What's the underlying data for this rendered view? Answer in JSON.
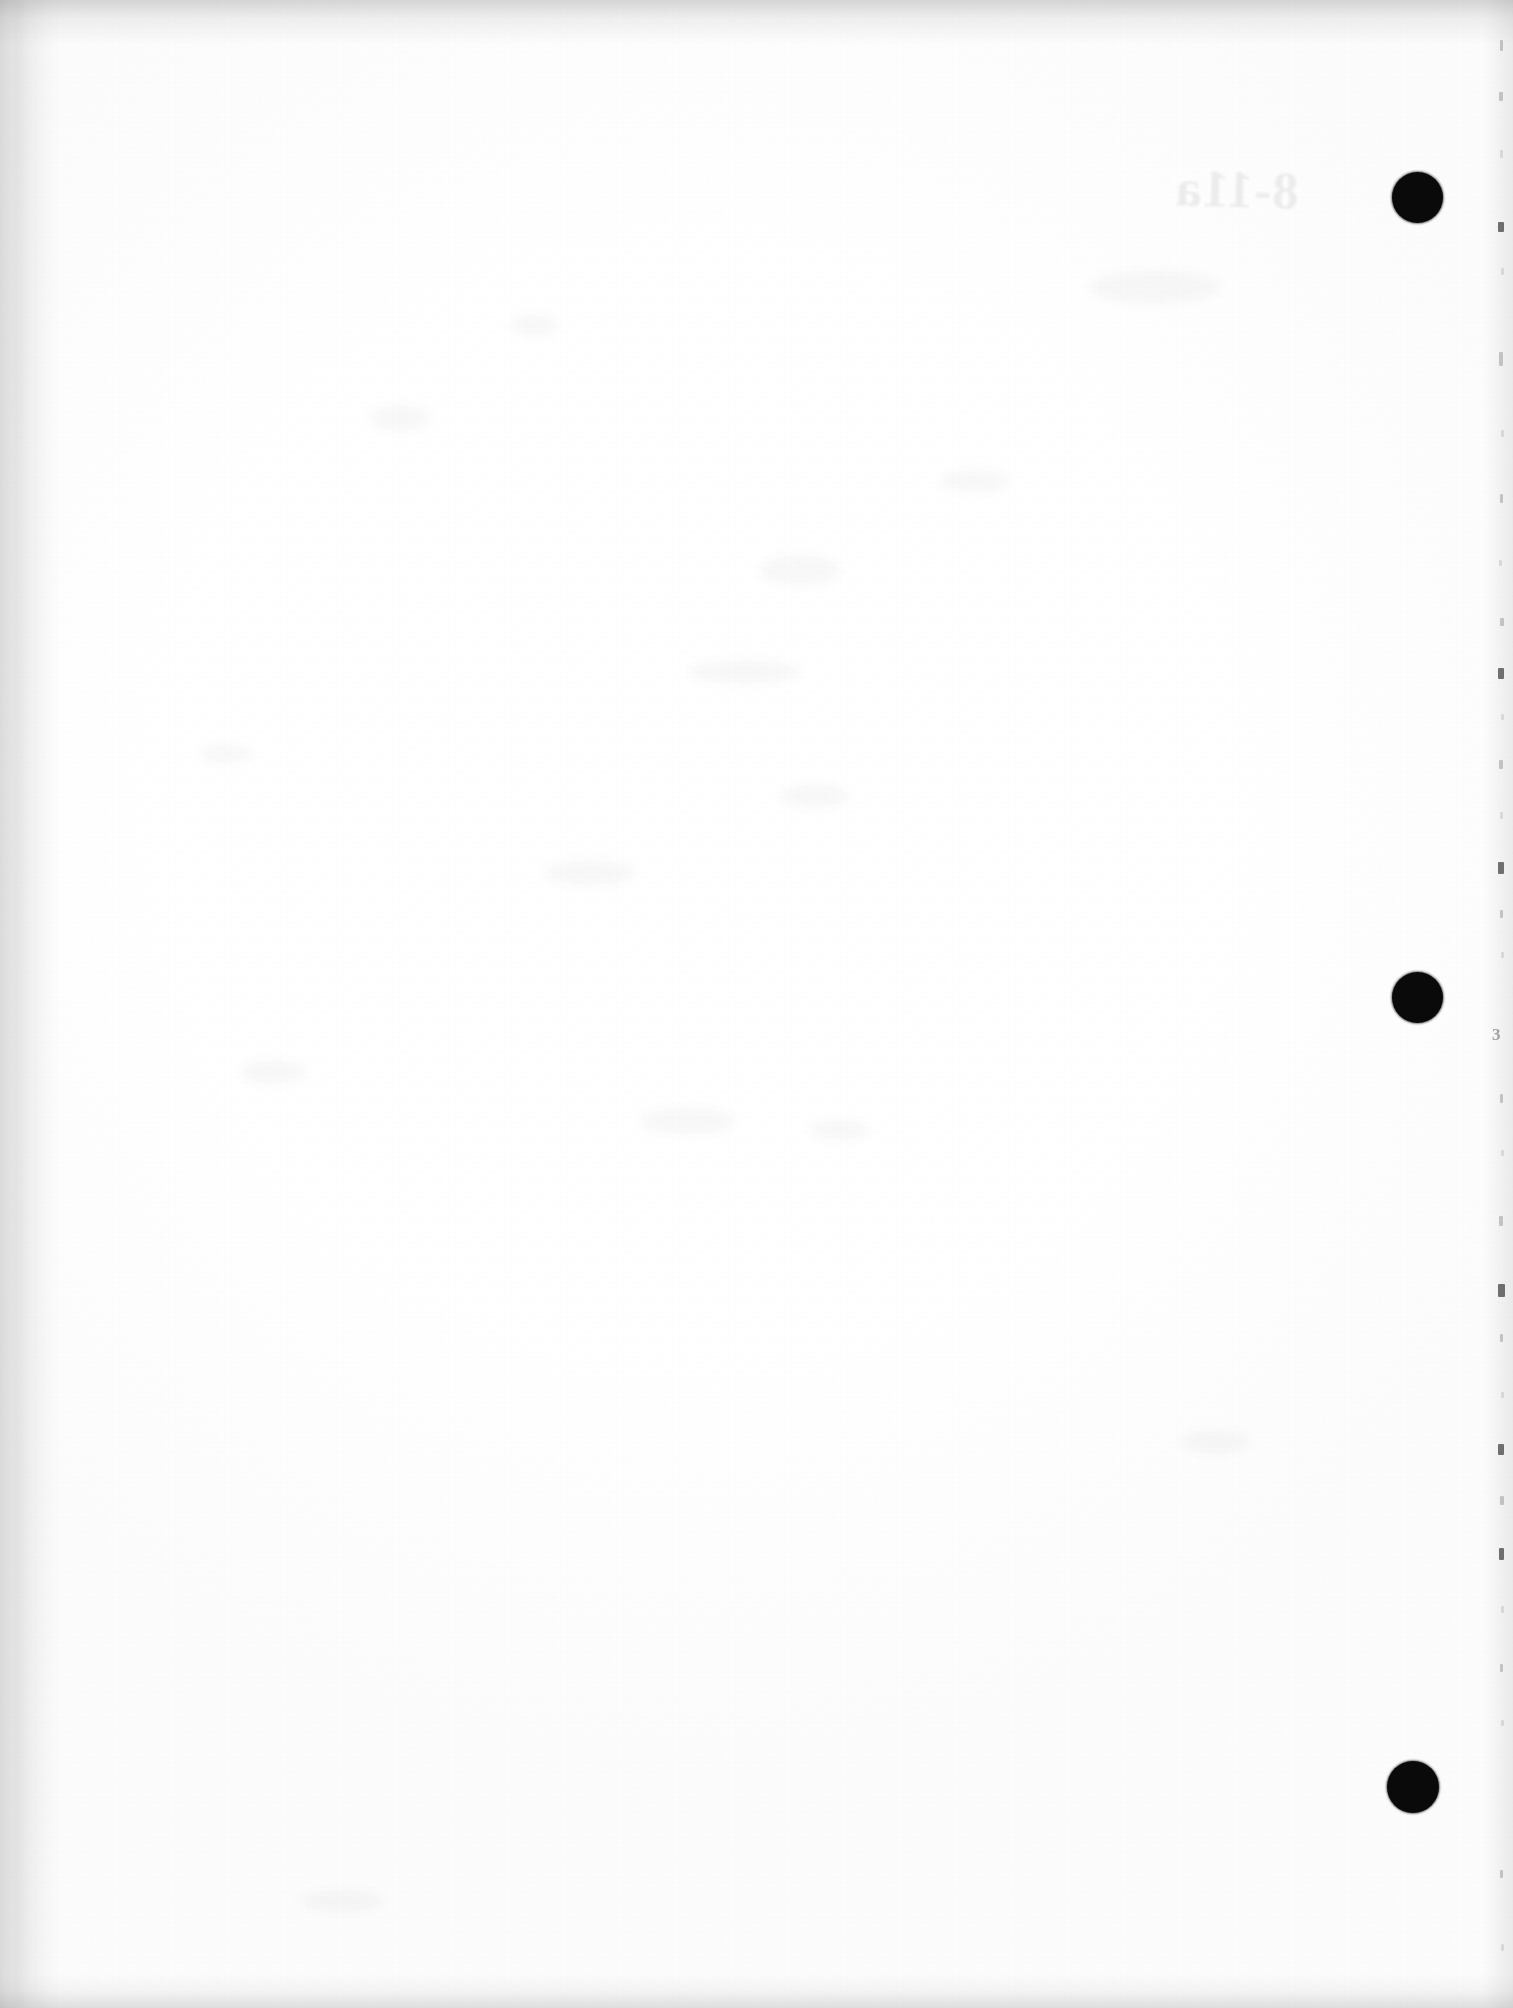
{
  "document": {
    "kind": "scanned-page",
    "title": "Blank scanned document page",
    "page_label": "3",
    "width_px": 1513,
    "height_px": 2008,
    "orientation": "portrait",
    "paper_color": "#fdfdfd",
    "ink_color": "#0a0a0a",
    "body_text": ""
  },
  "marks": {
    "punch_marks_label": "registration punch marks",
    "punch_marks": [
      {
        "name": "punch-mark-top",
        "x": 1417,
        "y": 197,
        "d": 51
      },
      {
        "name": "punch-mark-middle",
        "x": 1417,
        "y": 997,
        "d": 51
      },
      {
        "name": "punch-mark-bottom",
        "x": 1413,
        "y": 1787,
        "d": 52
      }
    ]
  },
  "showthrough": {
    "label": "show-through ghost text from reverse side",
    "text": "8-11a",
    "x": 1175,
    "y": 160,
    "size": 52
  },
  "margin": {
    "digit_label": "page number artifact",
    "digit": "3",
    "digit_x": 1492,
    "digit_y": 1025,
    "specks": [
      {
        "x": 1500,
        "y": 40,
        "w": 3,
        "h": 11,
        "t": "faint"
      },
      {
        "x": 1499,
        "y": 92,
        "w": 4,
        "h": 9,
        "t": "faint"
      },
      {
        "x": 1500,
        "y": 150,
        "w": 3,
        "h": 8,
        "t": "vfaint"
      },
      {
        "x": 1498,
        "y": 222,
        "w": 6,
        "h": 10,
        "t": "solid"
      },
      {
        "x": 1501,
        "y": 268,
        "w": 3,
        "h": 7,
        "t": "vfaint"
      },
      {
        "x": 1499,
        "y": 352,
        "w": 4,
        "h": 14,
        "t": "faint"
      },
      {
        "x": 1501,
        "y": 430,
        "w": 3,
        "h": 7,
        "t": "vfaint"
      },
      {
        "x": 1500,
        "y": 494,
        "w": 3,
        "h": 9,
        "t": "faint"
      },
      {
        "x": 1499,
        "y": 560,
        "w": 3,
        "h": 6,
        "t": "vfaint"
      },
      {
        "x": 1500,
        "y": 618,
        "w": 4,
        "h": 8,
        "t": "faint"
      },
      {
        "x": 1498,
        "y": 668,
        "w": 6,
        "h": 11,
        "t": "solid"
      },
      {
        "x": 1501,
        "y": 714,
        "w": 3,
        "h": 6,
        "t": "vfaint"
      },
      {
        "x": 1499,
        "y": 760,
        "w": 4,
        "h": 9,
        "t": "faint"
      },
      {
        "x": 1500,
        "y": 812,
        "w": 3,
        "h": 7,
        "t": "vfaint"
      },
      {
        "x": 1498,
        "y": 862,
        "w": 6,
        "h": 12,
        "t": "solid"
      },
      {
        "x": 1500,
        "y": 910,
        "w": 3,
        "h": 8,
        "t": "faint"
      },
      {
        "x": 1501,
        "y": 952,
        "w": 3,
        "h": 6,
        "t": "vfaint"
      },
      {
        "x": 1500,
        "y": 1094,
        "w": 3,
        "h": 9,
        "t": "faint"
      },
      {
        "x": 1501,
        "y": 1150,
        "w": 3,
        "h": 6,
        "t": "vfaint"
      },
      {
        "x": 1499,
        "y": 1216,
        "w": 4,
        "h": 10,
        "t": "faint"
      },
      {
        "x": 1498,
        "y": 1284,
        "w": 7,
        "h": 13,
        "t": "solid"
      },
      {
        "x": 1500,
        "y": 1334,
        "w": 3,
        "h": 8,
        "t": "faint"
      },
      {
        "x": 1501,
        "y": 1392,
        "w": 3,
        "h": 6,
        "t": "vfaint"
      },
      {
        "x": 1498,
        "y": 1444,
        "w": 6,
        "h": 11,
        "t": "solid"
      },
      {
        "x": 1500,
        "y": 1496,
        "w": 4,
        "h": 9,
        "t": "faint"
      },
      {
        "x": 1499,
        "y": 1548,
        "w": 5,
        "h": 12,
        "t": "solid"
      },
      {
        "x": 1501,
        "y": 1606,
        "w": 3,
        "h": 7,
        "t": "vfaint"
      },
      {
        "x": 1500,
        "y": 1664,
        "w": 3,
        "h": 8,
        "t": "faint"
      },
      {
        "x": 1501,
        "y": 1720,
        "w": 3,
        "h": 6,
        "t": "vfaint"
      },
      {
        "x": 1500,
        "y": 1870,
        "w": 3,
        "h": 8,
        "t": "faint"
      },
      {
        "x": 1501,
        "y": 1944,
        "w": 3,
        "h": 7,
        "t": "vfaint"
      }
    ]
  },
  "smudges": [
    {
      "x": 370,
      "y": 405,
      "w": 60,
      "h": 26
    },
    {
      "x": 510,
      "y": 315,
      "w": 48,
      "h": 20
    },
    {
      "x": 760,
      "y": 555,
      "w": 80,
      "h": 30
    },
    {
      "x": 690,
      "y": 660,
      "w": 110,
      "h": 24
    },
    {
      "x": 545,
      "y": 860,
      "w": 90,
      "h": 26
    },
    {
      "x": 780,
      "y": 785,
      "w": 70,
      "h": 22
    },
    {
      "x": 240,
      "y": 1060,
      "w": 66,
      "h": 24
    },
    {
      "x": 640,
      "y": 1108,
      "w": 96,
      "h": 26
    },
    {
      "x": 810,
      "y": 1120,
      "w": 58,
      "h": 20
    },
    {
      "x": 1090,
      "y": 270,
      "w": 130,
      "h": 34
    },
    {
      "x": 940,
      "y": 470,
      "w": 70,
      "h": 22
    },
    {
      "x": 200,
      "y": 745,
      "w": 52,
      "h": 18
    },
    {
      "x": 300,
      "y": 1890,
      "w": 84,
      "h": 22
    },
    {
      "x": 1180,
      "y": 1430,
      "w": 70,
      "h": 24
    }
  ]
}
